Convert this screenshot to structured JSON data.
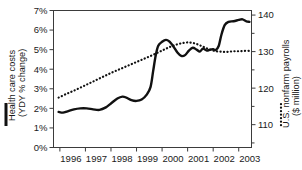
{
  "chart_data": {
    "type": "line",
    "title": "",
    "xlabel": "",
    "grid": false,
    "legend_position": "axis-labels",
    "x": [
      1996,
      1997,
      1998,
      1999,
      2000,
      2001,
      2002,
      2003
    ],
    "xlim": [
      1995.75,
      2003.5
    ],
    "xticklabels": [
      "1996",
      "1997",
      "1998",
      "1999",
      "2000",
      "2001",
      "2002",
      "2003"
    ],
    "left_axis": {
      "label": "Health care costs (YDY % change)",
      "label_line1": "Health care costs",
      "label_line2": "(YDY % change)",
      "ylim": [
        0,
        7
      ],
      "ticks": [
        0,
        1,
        2,
        3,
        4,
        5,
        6,
        7
      ],
      "ticklabels": [
        "0%",
        "1%",
        "2%",
        "3%",
        "4%",
        "5%",
        "6%",
        "7%"
      ],
      "marker": "solid-line"
    },
    "right_axis": {
      "label": "U.S. nonfarm payrolls ($ million)",
      "label_line1": "U.S. nonfarm payrolls",
      "label_line2": "($ million)",
      "ylim": [
        103.75,
        141.25
      ],
      "ticks": [
        110,
        120,
        130,
        140
      ],
      "ticklabels": [
        "110",
        "120",
        "130",
        "140"
      ],
      "minor_ticks": [
        105,
        115,
        125,
        135
      ],
      "marker": "dotted-line"
    },
    "series": [
      {
        "name": "Health care costs",
        "style": "solid",
        "axis": "left",
        "unit": "% change YoY",
        "points": [
          [
            1995.95,
            1.82
          ],
          [
            1996.12,
            1.78
          ],
          [
            1996.3,
            1.85
          ],
          [
            1996.55,
            1.95
          ],
          [
            1996.8,
            2.0
          ],
          [
            1997.05,
            2.0
          ],
          [
            1997.3,
            1.95
          ],
          [
            1997.55,
            1.92
          ],
          [
            1997.8,
            2.05
          ],
          [
            1998.0,
            2.25
          ],
          [
            1998.25,
            2.5
          ],
          [
            1998.45,
            2.6
          ],
          [
            1998.6,
            2.55
          ],
          [
            1998.8,
            2.42
          ],
          [
            1999.0,
            2.38
          ],
          [
            1999.2,
            2.45
          ],
          [
            1999.4,
            2.7
          ],
          [
            1999.55,
            3.1
          ],
          [
            1999.65,
            3.9
          ],
          [
            1999.75,
            4.7
          ],
          [
            1999.85,
            5.2
          ],
          [
            2000.0,
            5.4
          ],
          [
            2000.15,
            5.5
          ],
          [
            2000.28,
            5.42
          ],
          [
            2000.45,
            5.15
          ],
          [
            2000.6,
            4.85
          ],
          [
            2000.75,
            4.68
          ],
          [
            2000.9,
            4.72
          ],
          [
            2001.05,
            4.95
          ],
          [
            2001.2,
            5.1
          ],
          [
            2001.35,
            5.0
          ],
          [
            2001.48,
            4.9
          ],
          [
            2001.6,
            5.05
          ],
          [
            2001.75,
            4.95
          ],
          [
            2001.88,
            5.0
          ],
          [
            2002.0,
            5.02
          ],
          [
            2002.1,
            4.98
          ],
          [
            2002.22,
            5.2
          ],
          [
            2002.32,
            5.75
          ],
          [
            2002.45,
            6.25
          ],
          [
            2002.6,
            6.42
          ],
          [
            2002.8,
            6.45
          ],
          [
            2003.0,
            6.52
          ],
          [
            2003.15,
            6.55
          ],
          [
            2003.3,
            6.45
          ],
          [
            2003.42,
            6.42
          ]
        ]
      },
      {
        "name": "U.S. nonfarm payrolls",
        "style": "dotted",
        "axis": "right",
        "unit": "$ million",
        "points": [
          [
            1995.95,
            117.4
          ],
          [
            1996.25,
            118.4
          ],
          [
            1996.55,
            119.3
          ],
          [
            1996.85,
            120.3
          ],
          [
            1997.15,
            121.3
          ],
          [
            1997.45,
            122.3
          ],
          [
            1997.75,
            123.3
          ],
          [
            1998.05,
            124.3
          ],
          [
            1998.35,
            125.2
          ],
          [
            1998.65,
            126.1
          ],
          [
            1998.95,
            127.0
          ],
          [
            1999.25,
            127.9
          ],
          [
            1999.55,
            128.8
          ],
          [
            1999.85,
            129.8
          ],
          [
            2000.1,
            130.6
          ],
          [
            2000.35,
            131.4
          ],
          [
            2000.6,
            132.0
          ],
          [
            2000.85,
            132.4
          ],
          [
            2001.05,
            132.5
          ],
          [
            2001.25,
            132.3
          ],
          [
            2001.45,
            131.8
          ],
          [
            2001.65,
            131.2
          ],
          [
            2001.85,
            130.6
          ],
          [
            2002.05,
            130.2
          ],
          [
            2002.25,
            130.0
          ],
          [
            2002.45,
            129.9
          ],
          [
            2002.65,
            130.0
          ],
          [
            2002.85,
            130.1
          ],
          [
            2003.05,
            130.1
          ],
          [
            2003.25,
            130.2
          ],
          [
            2003.42,
            130.2
          ]
        ]
      }
    ]
  }
}
